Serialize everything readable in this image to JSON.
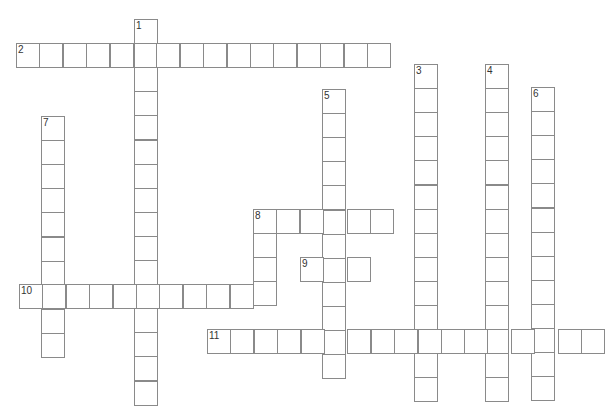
{
  "puzzle": {
    "type": "crossword",
    "words": [
      {
        "number": "1",
        "direction": "down",
        "length": 16
      },
      {
        "number": "2",
        "direction": "across",
        "length": 16
      },
      {
        "number": "3",
        "direction": "down",
        "length": 14
      },
      {
        "number": "4",
        "direction": "down",
        "length": 14
      },
      {
        "number": "5",
        "direction": "down",
        "length": 12
      },
      {
        "number": "6",
        "direction": "down",
        "length": 13
      },
      {
        "number": "7",
        "direction": "down",
        "length": 10
      },
      {
        "number": "8",
        "direction": "across",
        "length": 6
      },
      {
        "number": "8",
        "direction": "down",
        "length": 4
      },
      {
        "number": "9",
        "direction": "across",
        "length": 3
      },
      {
        "number": "10",
        "direction": "across",
        "length": 11
      },
      {
        "number": "11",
        "direction": "across",
        "length": 17
      }
    ],
    "colors": {
      "cell_border": "#8a8a8a",
      "number_text": "#333333",
      "background": "#ffffff"
    }
  }
}
